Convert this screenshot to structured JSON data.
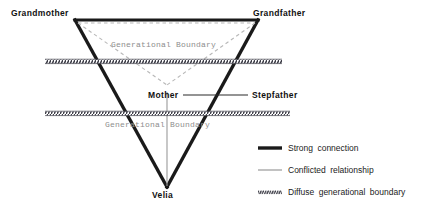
{
  "diagram": {
    "nodes": [
      {
        "id": "grandmother",
        "label": "Grandmother"
      },
      {
        "id": "grandfather",
        "label": "Grandfather"
      },
      {
        "id": "mother",
        "label": "Mother"
      },
      {
        "id": "stepfather",
        "label": "Stepfather"
      },
      {
        "id": "velia",
        "label": "Velia"
      }
    ],
    "boundaries": [
      {
        "id": "boundary-upper",
        "label": "Generational Boundary"
      },
      {
        "id": "boundary-lower",
        "label": "Generational Boundary"
      }
    ],
    "colors": {
      "strong": "#1a1a1a",
      "conflicted": "#9a9a9a",
      "diffuse": "#55555f",
      "dashed": "#b4b4b4",
      "background": "#ffffff",
      "label": "#111111",
      "boundary_text": "#8e8e8e"
    }
  },
  "legend": {
    "items": [
      {
        "id": "strong-connection",
        "label": "Strong connection",
        "style": "thick-solid"
      },
      {
        "id": "conflicted-relationship",
        "label": "Conflicted relationship",
        "style": "thin-solid"
      },
      {
        "id": "diffuse-generational-boundary",
        "label": "Diffuse generational boundary",
        "style": "hatched"
      }
    ]
  }
}
